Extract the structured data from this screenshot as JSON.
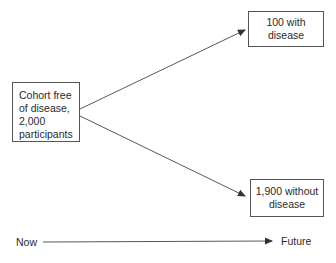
{
  "diagram": {
    "type": "flow",
    "source_box": {
      "lines": [
        "Cohort free",
        "of disease,",
        "2,000",
        "participants"
      ]
    },
    "outcome_top": {
      "lines": [
        "100 with",
        "disease"
      ]
    },
    "outcome_bottom": {
      "lines": [
        "1,900 without",
        "disease"
      ]
    },
    "timeline": {
      "start_label": "Now",
      "end_label": "Future"
    },
    "edges": [
      {
        "from": "source_box",
        "to": "outcome_top"
      },
      {
        "from": "source_box",
        "to": "outcome_bottom"
      },
      {
        "from": "timeline.start_label",
        "to": "timeline.end_label"
      }
    ],
    "colors": {
      "line": "#444444",
      "border": "#555555",
      "text": "#2a2a2a",
      "background": "#ffffff"
    }
  }
}
